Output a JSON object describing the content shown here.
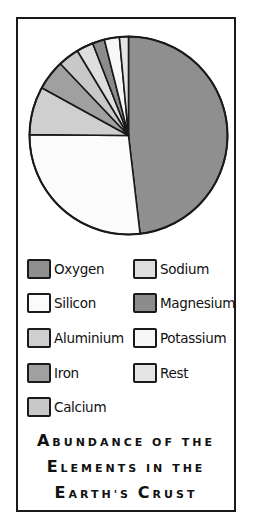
{
  "chart_data": {
    "type": "pie",
    "start_angle_deg": 0,
    "direction": "clockwise",
    "slices": [
      {
        "label": "Oxygen",
        "value": 49.0,
        "color": "#8f8f8f"
      },
      {
        "label": "Silicon",
        "value": 27.5,
        "color": "#fbfbfb"
      },
      {
        "label": "Aluminium",
        "value": 8.0,
        "color": "#cfcfcf"
      },
      {
        "label": "Iron",
        "value": 5.0,
        "color": "#a0a0a0"
      },
      {
        "label": "Calcium",
        "value": 3.5,
        "color": "#c8c8c8"
      },
      {
        "label": "Sodium",
        "value": 2.8,
        "color": "#dedede"
      },
      {
        "label": "Magnesium",
        "value": 2.0,
        "color": "#8c8c8c"
      },
      {
        "label": "Potassium",
        "value": 2.5,
        "color": "#f7f7f7"
      },
      {
        "label": "Rest",
        "value": 1.5,
        "color": "#e4e4e4"
      }
    ],
    "legend_position": "below",
    "xlabel": "",
    "ylabel": ""
  },
  "legend": {
    "items": [
      {
        "label": "Oxygen",
        "color": "#8f8f8f"
      },
      {
        "label": "Silicon",
        "color": "#fbfbfb"
      },
      {
        "label": "Aluminium",
        "color": "#cfcfcf"
      },
      {
        "label": "Iron",
        "color": "#a0a0a0"
      },
      {
        "label": "Calcium",
        "color": "#c8c8c8"
      },
      {
        "label": "Sodium",
        "color": "#dedede"
      },
      {
        "label": "Magnesium",
        "color": "#8c8c8c"
      },
      {
        "label": "Potassium",
        "color": "#f7f7f7"
      },
      {
        "label": "Rest",
        "color": "#e4e4e4"
      }
    ]
  },
  "title": {
    "lines": [
      [
        {
          "c": "A",
          "t": "BUNDANCE OF THE"
        }
      ],
      [
        {
          "c": "E",
          "t": "LEMENTS IN THE"
        }
      ],
      [
        {
          "c": "E",
          "t": "ARTH'S "
        },
        {
          "c": "C",
          "t": "RUST"
        }
      ]
    ]
  }
}
